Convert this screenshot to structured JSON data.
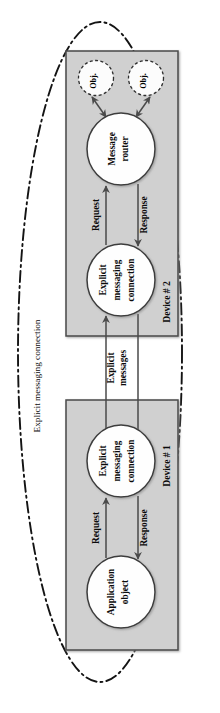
{
  "figure": {
    "orientation_deg": 90,
    "background_color": "#ffffff",
    "device_fill": "#d0d0d0",
    "device_stroke": "#4a4a4a",
    "node_fill": "#fefefe",
    "node_stroke": "#3c3c3c",
    "arrow_color": "#4a4a4a",
    "outer_boundary_color": "#141414",
    "text_color": "#0b0b0b"
  },
  "outer_boundary": {
    "label": "Explicit messaging connection",
    "style": "dash-dot-ellipse"
  },
  "devices": [
    {
      "id": "device-2",
      "label": "Device # 2",
      "nodes": [
        {
          "id": "obj-1",
          "label": "Obj.",
          "shape": "dashed-circle"
        },
        {
          "id": "obj-2",
          "label": "Obj.",
          "shape": "dashed-circle"
        },
        {
          "id": "message-router",
          "label_lines": [
            "Message",
            "router"
          ],
          "shape": "circle"
        },
        {
          "id": "explicit-messaging-connection-2",
          "label_lines": [
            "Explicit",
            "messaging",
            "connection"
          ],
          "shape": "circle"
        }
      ],
      "edges": [
        {
          "id": "d2-request",
          "label": "Request",
          "from": "explicit-messaging-connection-2",
          "to": "message-router"
        },
        {
          "id": "d2-response",
          "label": "Response",
          "from": "message-router",
          "to": "explicit-messaging-connection-2"
        },
        {
          "id": "d2-router-obj1",
          "label": "",
          "from": "message-router",
          "to": "obj-1",
          "bidirectional": true
        },
        {
          "id": "d2-router-obj2",
          "label": "",
          "from": "message-router",
          "to": "obj-2",
          "bidirectional": true
        }
      ]
    },
    {
      "id": "device-1",
      "label": "Device # 1",
      "nodes": [
        {
          "id": "explicit-messaging-connection-1",
          "label_lines": [
            "Explicit",
            "messaging",
            "connection"
          ],
          "shape": "circle"
        },
        {
          "id": "application-object",
          "label_lines": [
            "Application",
            "object"
          ],
          "shape": "circle"
        }
      ],
      "edges": [
        {
          "id": "d1-request",
          "label": "Request",
          "from": "application-object",
          "to": "explicit-messaging-connection-1"
        },
        {
          "id": "d1-response",
          "label": "Response",
          "from": "explicit-messaging-connection-1",
          "to": "application-object"
        }
      ]
    }
  ],
  "inter_device_link": {
    "id": "explicit-messages",
    "label_lines": [
      "Explicit",
      "messages"
    ],
    "from": "device-1",
    "to": "device-2"
  }
}
